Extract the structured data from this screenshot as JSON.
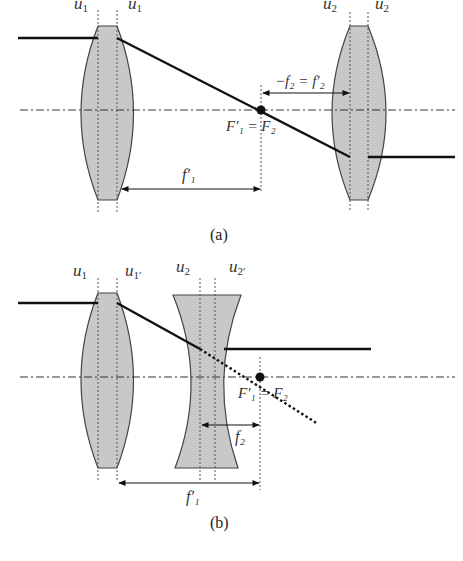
{
  "figure": {
    "panel_a": {
      "caption": "(a)",
      "lens1_labels": [
        "u",
        "u"
      ],
      "lens1_subs": [
        "1",
        "1"
      ],
      "lens2_labels": [
        "u",
        "u"
      ],
      "lens2_subs": [
        "2",
        "2"
      ],
      "focal_point_label": "F′₁ = F₂",
      "dim_f1_label": "f′₁",
      "dim_f2_label": "−f₂ = f′₂"
    },
    "panel_b": {
      "caption": "(b)",
      "lens1_labels": [
        "u",
        "u"
      ],
      "lens1_subs": [
        "1",
        "1′"
      ],
      "lens2_labels": [
        "u",
        "u"
      ],
      "lens2_subs": [
        "2",
        "2′"
      ],
      "focal_point_label": "F′₁ = F₂",
      "dim_f2_label": "f₂",
      "dim_f1_label": "f′₁"
    }
  }
}
